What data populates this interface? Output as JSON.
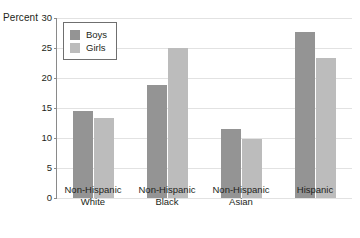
{
  "chart_data": {
    "type": "bar",
    "title": "",
    "subtitle": "",
    "xlabel": "",
    "ylabel": "Percent",
    "ylim": [
      0,
      30
    ],
    "yticks": [
      0,
      5,
      10,
      15,
      20,
      25,
      30
    ],
    "ytick_labels": [
      "0",
      "5",
      "10",
      "15",
      "20",
      "25",
      "30"
    ],
    "grid": true,
    "legend_position": "top-left",
    "categories": [
      "Non-Hispanic White",
      "Non-Hispanic Black",
      "Non-Hispanic Asian",
      "Hispanic"
    ],
    "category_lines": [
      [
        "Non-Hispanic",
        "White"
      ],
      [
        "Non-Hispanic",
        "Black"
      ],
      [
        "Non-Hispanic",
        "Asian"
      ],
      [
        "Hispanic",
        ""
      ]
    ],
    "series": [
      {
        "name": "Boys",
        "color": "#949494",
        "values": [
          14.5,
          18.9,
          11.5,
          27.7
        ]
      },
      {
        "name": "Girls",
        "color": "#bcbcbc",
        "values": [
          13.4,
          25.0,
          9.9,
          23.3
        ]
      }
    ]
  },
  "legend": {
    "items": [
      {
        "label": "Boys",
        "swatch": "boys"
      },
      {
        "label": "Girls",
        "swatch": "girls"
      }
    ]
  },
  "colors": {
    "boys": "#949494",
    "girls": "#bcbcbc",
    "axis": "#8a8a8a",
    "grid": "#e2e2e2",
    "text": "#231f20",
    "background": "#ffffff"
  }
}
